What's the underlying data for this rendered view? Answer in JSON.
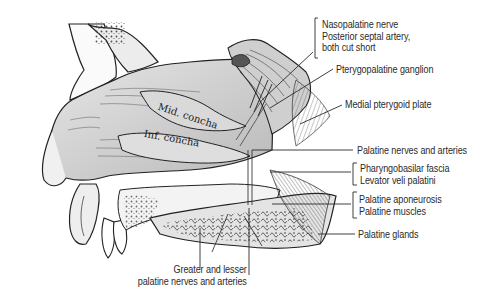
{
  "figure": {
    "background_color": "#ffffff",
    "line_color": "#2a2a2a",
    "in_drawing_labels": [
      {
        "id": "mid-concha",
        "text": "Mid. concha"
      },
      {
        "id": "inf-concha",
        "text": "Inf. concha"
      }
    ],
    "callouts": [
      {
        "id": "nasopalatine",
        "lines": [
          "Nasopalatine nerve",
          "Posterior septal artery,",
          "both cut short"
        ],
        "bracket": true
      },
      {
        "id": "pterygopalatine-ganglion",
        "lines": [
          "Pterygopalatine ganglion"
        ],
        "bracket": false
      },
      {
        "id": "medial-pterygoid-plate",
        "lines": [
          "Medial pterygoid plate"
        ],
        "bracket": false
      },
      {
        "id": "palatine-nerves-arteries",
        "lines": [
          "Palatine nerves and arteries"
        ],
        "bracket": false
      },
      {
        "id": "pharyngobasilar",
        "lines": [
          "Pharyngobasilar fascia",
          "Levator veli palatini"
        ],
        "bracket": true
      },
      {
        "id": "palatine-aponeurosis",
        "lines": [
          "Palatine aponeurosis",
          "Palatine muscles"
        ],
        "bracket": true
      },
      {
        "id": "palatine-glands",
        "lines": [
          "Palatine glands"
        ],
        "bracket": false
      },
      {
        "id": "greater-lesser",
        "lines": [
          "Greater and lesser",
          "palatine nerves and arteries"
        ],
        "bracket": false
      }
    ]
  }
}
